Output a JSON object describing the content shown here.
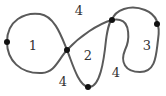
{
  "diagram": {
    "type": "closed self-intersecting curve with region labels",
    "stroke_color": "#5a5a5a",
    "dot_color": "#111111",
    "region_labels": [
      {
        "id": "region-1",
        "text": "1",
        "x": 33,
        "y": 45
      },
      {
        "id": "region-2",
        "text": "2",
        "x": 88,
        "y": 55
      },
      {
        "id": "region-3",
        "text": "3",
        "x": 147,
        "y": 45
      },
      {
        "id": "region-4-top",
        "text": "4",
        "x": 79,
        "y": 10
      },
      {
        "id": "region-4-bottom-left",
        "text": "4",
        "x": 63,
        "y": 81
      },
      {
        "id": "region-4-bottom-right",
        "text": "4",
        "x": 116,
        "y": 72
      }
    ],
    "vertices": [
      {
        "id": "dot-left",
        "x": 7,
        "y": 42
      },
      {
        "id": "dot-center-crossing",
        "x": 67,
        "y": 50
      },
      {
        "id": "dot-top-crossing",
        "x": 112,
        "y": 20
      },
      {
        "id": "dot-right",
        "x": 157,
        "y": 24
      },
      {
        "id": "dot-bottom",
        "x": 88,
        "y": 87
      }
    ]
  }
}
